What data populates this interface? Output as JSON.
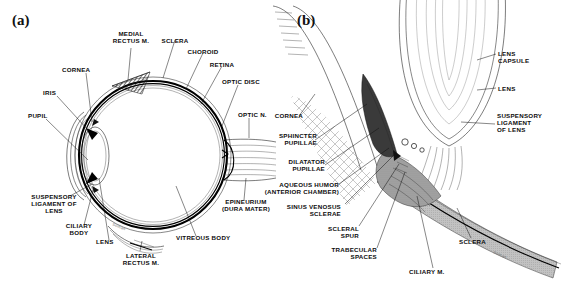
{
  "figure": {
    "panel_a_label": "(a)",
    "panel_b_label": "(b)",
    "artist_signature": "Soman"
  },
  "panel_a": {
    "title": "Sagittal section of the eyeball",
    "labels": [
      {
        "id": "medial-rectus-m",
        "text": "MEDIAL\nRECTUS M."
      },
      {
        "id": "sclera",
        "text": "SCLERA"
      },
      {
        "id": "choroid",
        "text": "CHOROID"
      },
      {
        "id": "retina",
        "text": "RETINA"
      },
      {
        "id": "optic-disc",
        "text": "OPTIC DISC"
      },
      {
        "id": "optic-n",
        "text": "OPTIC N."
      },
      {
        "id": "cornea",
        "text": "CORNEA"
      },
      {
        "id": "iris",
        "text": "IRIS"
      },
      {
        "id": "pupil",
        "text": "PUPIL"
      },
      {
        "id": "suspensory-ligament-of-lens",
        "text": "SUSPENSORY\nLIGAMENT OF\nLENS"
      },
      {
        "id": "ciliary-body",
        "text": "CILIARY\nBODY"
      },
      {
        "id": "lens",
        "text": "LENS"
      },
      {
        "id": "lateral-rectus-m",
        "text": "LATERAL\nRECTUS M."
      },
      {
        "id": "vitreous-body",
        "text": "VITREOUS BODY"
      },
      {
        "id": "epineurium-dura-mater",
        "text": "EPINEURIUM\n(DURA MATER)"
      }
    ]
  },
  "panel_b": {
    "title": "Detail of the iridocorneal angle and lens",
    "labels": [
      {
        "id": "lens-capsule",
        "text": "LENS\nCAPSULE"
      },
      {
        "id": "lens",
        "text": "LENS"
      },
      {
        "id": "suspensory-ligament-of-lens",
        "text": "SUSPENSORY\nLIGAMENT\nOF LENS"
      },
      {
        "id": "cornea",
        "text": "CORNEA"
      },
      {
        "id": "sphincter-pupillae",
        "text": "SPHINCTER\nPUPILLAE"
      },
      {
        "id": "dilatator-pupillae",
        "text": "DILATATOR\nPUPILLAE"
      },
      {
        "id": "aqueous-humor-anterior-chamber",
        "text": "AQUEOUS HUMOR\n(ANTERIOR CHAMBER)"
      },
      {
        "id": "sinus-venosus-sclerae",
        "text": "SINUS VENOSUS\nSCLERAE"
      },
      {
        "id": "scleral-spur",
        "text": "SCLERAL\nSPUR"
      },
      {
        "id": "trabecular-spaces",
        "text": "TRABECULAR\nSPACES"
      },
      {
        "id": "ciliary-m",
        "text": "CILIARY M."
      },
      {
        "id": "sclera",
        "text": "SCLERA"
      }
    ]
  },
  "colors": {
    "ink": "#111111",
    "background": "#ffffff",
    "sclera_fill": "#b9b9b9",
    "tissue_fill": "#9a9a9a"
  }
}
